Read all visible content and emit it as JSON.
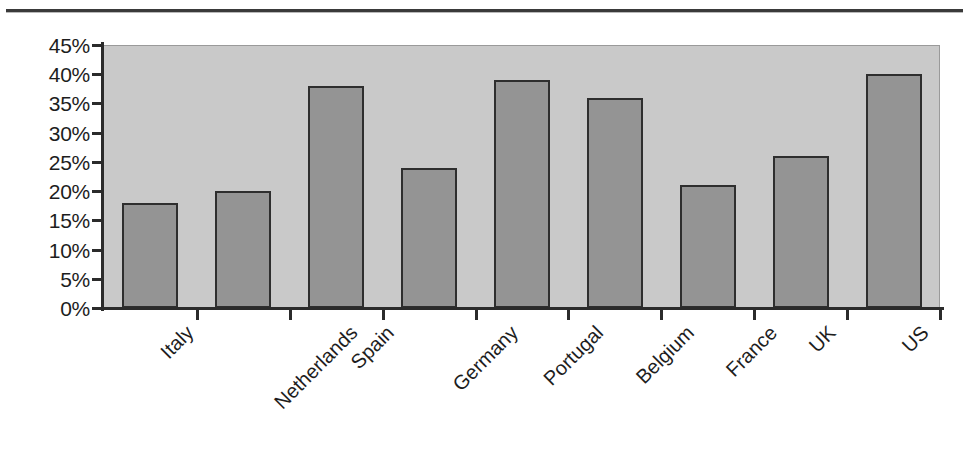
{
  "chart_data": {
    "type": "bar",
    "title": "",
    "xlabel": "",
    "ylabel": "",
    "categories": [
      "Italy",
      "Netherlands",
      "Spain",
      "Germany",
      "Portugal",
      "Belgium",
      "France",
      "UK",
      "US"
    ],
    "values": [
      18,
      20,
      38,
      24,
      39,
      36,
      21,
      26,
      40
    ],
    "value_suffix": "%",
    "ylim": [
      0,
      45
    ],
    "ytick_step": 5,
    "ytick_labels": [
      "45%",
      "40%",
      "35%",
      "30%",
      "25%",
      "20%",
      "15%",
      "10%",
      "5%",
      "0%"
    ],
    "ytick_values": [
      45,
      40,
      35,
      30,
      25,
      20,
      15,
      10,
      5,
      0
    ],
    "grid": false,
    "legend": null,
    "legend_position": "none",
    "x_label_rotation_deg": -45,
    "colors": {
      "bar_fill": "#949494",
      "bar_border": "#2e2e2e",
      "plot_background": "#c9c9c9",
      "axis": "#2b2b2b",
      "text": "#1d1d1d",
      "page_background": "#ffffff",
      "rule": "#3a3a3a"
    }
  }
}
